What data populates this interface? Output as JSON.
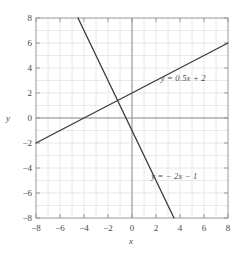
{
  "chart_data": {
    "type": "line",
    "title": "",
    "xlabel": "x",
    "ylabel": "y",
    "xlim": [
      -8,
      8
    ],
    "ylim": [
      -8,
      8
    ],
    "grid": true,
    "grid_step": 1,
    "tick_step": 2,
    "legend": "inline-annotations",
    "xticks": [
      "−8",
      "−6",
      "−4",
      "−2",
      "0",
      "2",
      "4",
      "6",
      "8"
    ],
    "xtick_values": [
      -8,
      -6,
      -4,
      -2,
      0,
      2,
      4,
      6,
      8
    ],
    "yticks": [
      "8",
      "6",
      "4",
      "2",
      "0",
      "−2",
      "−4",
      "−6",
      "−8"
    ],
    "ytick_values": [
      8,
      6,
      4,
      2,
      0,
      -2,
      -4,
      -6,
      -8
    ],
    "series": [
      {
        "name": "y = 0.5x + 2",
        "label": "y = 0.5x + 2",
        "slope": 0.5,
        "intercept": 2,
        "color": "#3a3a3a",
        "x": [
          -8,
          8
        ],
        "values": [
          -2,
          6
        ],
        "label_x": 2.4,
        "label_y": 3.1
      },
      {
        "name": "y = −2x − 1",
        "label": "y = − 2x − 1",
        "slope": -2,
        "intercept": -1,
        "color": "#3a3a3a",
        "x": [
          -4.5,
          3.5
        ],
        "values": [
          8,
          -8
        ],
        "label_x": 1.6,
        "label_y": -4.7
      }
    ],
    "intersection": {
      "x": -1.2,
      "y": 1.4
    },
    "colors": {
      "grid": "#e2e2e8",
      "axis": "#8f8f96",
      "line": "#3a3a3a",
      "text": "#4a4a4a",
      "background": "#ffffff"
    }
  }
}
